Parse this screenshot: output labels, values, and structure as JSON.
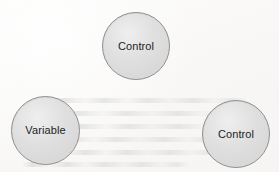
{
  "diagram": {
    "background_color": "#fbfaf9",
    "node_fill_color": "#dbdbdb",
    "node_border_color": "#8f8f8f",
    "node_label_color": "#1d1d1d",
    "nodes": [
      {
        "id": "control-top",
        "label": "Control",
        "shape": "circle",
        "position": "top-center",
        "center_x": 136,
        "center_y": 46,
        "diameter": 68
      },
      {
        "id": "variable-left",
        "label": "Variable",
        "shape": "circle",
        "position": "bottom-left",
        "center_x": 45,
        "center_y": 130,
        "diameter": 69
      },
      {
        "id": "control-right",
        "label": "Control",
        "shape": "circle",
        "position": "bottom-right",
        "center_x": 236,
        "center_y": 134,
        "diameter": 68
      }
    ]
  }
}
